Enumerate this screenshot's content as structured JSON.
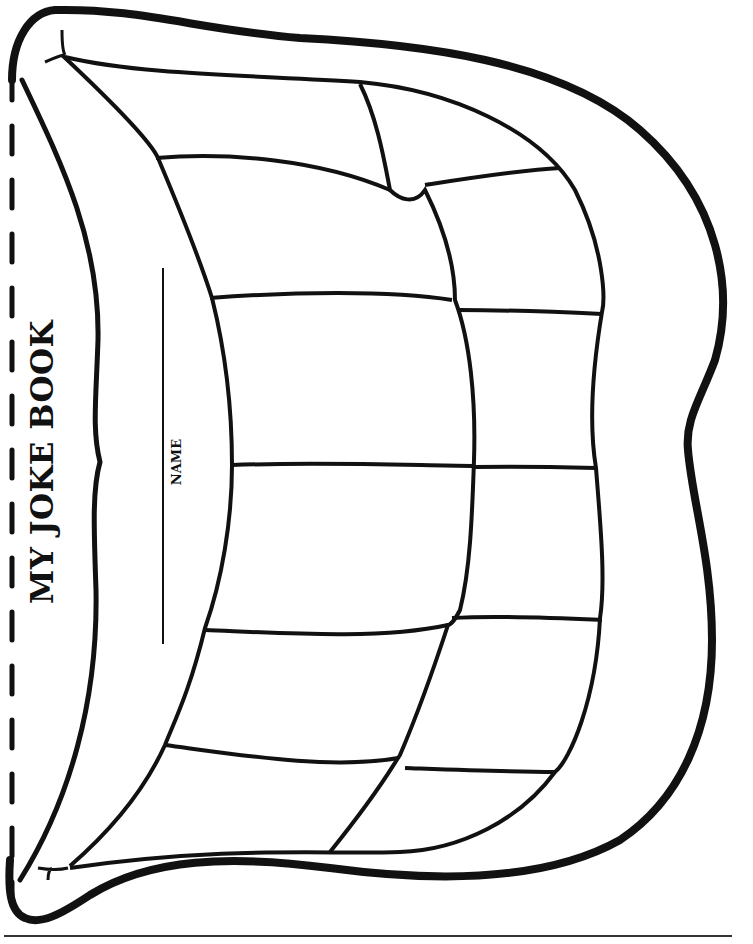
{
  "worksheet": {
    "title": "MY JOKE BOOK",
    "name_label": "NAME",
    "cut_line_style": "dashed",
    "teeth": {
      "outer_row_count": 6,
      "inner_row_count": 6
    },
    "colors": {
      "ink": "#111111",
      "paper": "#ffffff"
    }
  }
}
